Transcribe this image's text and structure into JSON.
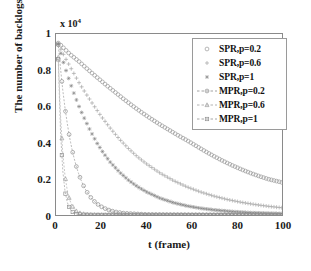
{
  "chart_data": {
    "type": "line",
    "title": "",
    "xlabel": "t (frame)",
    "ylabel": "The number of backlogs",
    "y_multiplier": "x 10",
    "y_multiplier_exp": "4",
    "xlim": [
      0,
      100
    ],
    "ylim": [
      0,
      10000
    ],
    "xticks": [
      0,
      20,
      40,
      60,
      80,
      100
    ],
    "xtick_labels": [
      "0",
      "20",
      "40",
      "60",
      "80",
      "100"
    ],
    "yticks": [
      0,
      2000,
      4000,
      6000,
      8000,
      10000
    ],
    "ytick_labels": [
      "0",
      "0.2",
      "0.4",
      "0.6",
      "0.8",
      "1"
    ],
    "grid": false,
    "legend_position": "upper right",
    "series": [
      {
        "name": "SPR,p=0.2",
        "marker": "circle-open",
        "line": "none",
        "color": "#9a9a9a",
        "x": [
          1,
          2,
          4,
          6,
          8,
          10,
          14,
          18,
          22,
          26,
          30,
          34,
          38,
          42,
          46,
          50,
          54,
          58,
          62,
          66,
          70,
          74,
          78,
          82,
          86,
          90,
          94,
          100
        ],
        "values": [
          9500,
          9400,
          9150,
          8900,
          8700,
          8500,
          8050,
          7620,
          7200,
          6800,
          6400,
          6020,
          5660,
          5320,
          5000,
          4700,
          4400,
          4120,
          3820,
          3520,
          3240,
          2980,
          2740,
          2520,
          2320,
          2140,
          1980,
          1800
        ]
      },
      {
        "name": "SPR,p=0.6",
        "marker": "plus",
        "line": "none",
        "color": "#a5a5a5",
        "x": [
          1,
          2,
          4,
          6,
          8,
          10,
          13,
          16,
          20,
          24,
          28,
          32,
          36,
          40,
          46,
          52,
          58,
          64,
          70,
          76,
          82,
          88,
          94,
          100
        ],
        "values": [
          9480,
          9200,
          8700,
          8250,
          7800,
          7350,
          6750,
          6180,
          5450,
          4800,
          4200,
          3680,
          3220,
          2830,
          2320,
          1900,
          1550,
          1270,
          1040,
          850,
          700,
          580,
          480,
          400
        ]
      },
      {
        "name": "SPR,p=1",
        "marker": "star",
        "line": "none",
        "color": "#808080",
        "x": [
          1,
          2,
          3,
          4,
          6,
          8,
          10,
          12,
          15,
          18,
          21,
          24,
          28,
          32,
          36,
          40,
          46,
          52,
          58,
          64,
          70,
          78,
          86,
          94,
          100
        ],
        "values": [
          9450,
          9000,
          8550,
          8150,
          7400,
          6700,
          6050,
          5480,
          4700,
          4000,
          3420,
          2920,
          2380,
          1930,
          1570,
          1280,
          930,
          680,
          500,
          370,
          280,
          190,
          130,
          95,
          80
        ]
      },
      {
        "name": "MPR,p=0.2",
        "marker": "circle-open",
        "line": "dashed",
        "color": "#8c8c8c",
        "x": [
          1,
          2,
          3,
          4,
          5,
          6,
          7,
          8,
          9,
          10,
          11,
          12,
          13,
          14,
          15,
          16,
          17,
          18,
          19,
          20,
          22,
          24,
          26,
          30,
          40,
          60,
          80,
          100
        ],
        "values": [
          9400,
          8100,
          6900,
          5900,
          5050,
          4300,
          3680,
          3140,
          2680,
          2290,
          1950,
          1660,
          1420,
          1210,
          1030,
          880,
          750,
          640,
          545,
          465,
          340,
          245,
          180,
          100,
          30,
          10,
          5,
          3
        ]
      },
      {
        "name": "MPR,p=0.6",
        "marker": "triangle-open",
        "line": "dashed",
        "color": "#9e9e9e",
        "x": [
          1,
          2,
          3,
          4,
          5,
          6,
          7,
          8,
          9,
          10,
          11,
          12,
          14,
          16,
          18,
          20,
          24,
          30,
          40,
          60,
          80,
          100
        ],
        "values": [
          8700,
          5500,
          3400,
          2150,
          1350,
          850,
          540,
          340,
          215,
          135,
          90,
          60,
          30,
          15,
          10,
          8,
          5,
          4,
          3,
          2,
          2,
          2
        ]
      },
      {
        "name": "MPR,p=1",
        "marker": "square-open",
        "line": "dashed",
        "color": "#909090",
        "x": [
          1,
          2,
          3,
          4,
          5,
          6,
          7,
          8,
          9,
          10,
          12,
          14,
          18,
          24,
          30,
          40,
          60,
          80,
          100
        ],
        "values": [
          8600,
          4600,
          2450,
          1300,
          700,
          380,
          205,
          110,
          60,
          35,
          15,
          8,
          4,
          3,
          2,
          2,
          2,
          2,
          2
        ]
      }
    ]
  }
}
